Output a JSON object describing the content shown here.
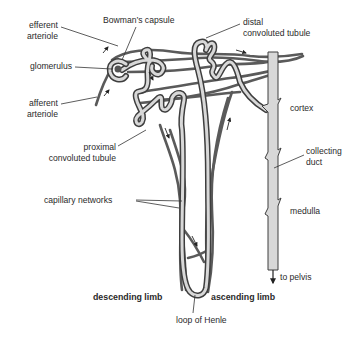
{
  "diagram": {
    "colors": {
      "vessel": "#555555",
      "tubule_outline": "#444444",
      "tubule_fill": "#d9d9d9",
      "leader_line": "#333333",
      "text": "#2a2a2a",
      "background": "#ffffff"
    },
    "labels": {
      "efferent_arteriole": [
        "efferent",
        "arteriole"
      ],
      "bowmans_capsule": "Bowman’s capsule",
      "distal_tubule": [
        "distal",
        "convoluted tubule"
      ],
      "glomerulus": "glomerulus",
      "afferent_arteriole": [
        "afferent",
        "arteriole"
      ],
      "cortex": "cortex",
      "proximal_tubule": [
        "proximal",
        "convoluted tubule"
      ],
      "collecting_duct": [
        "collecting",
        "duct"
      ],
      "capillary_networks": "capillary networks",
      "medulla": "medulla",
      "to_pelvis": "to pelvis",
      "descending_limb": "descending limb",
      "ascending_limb": "ascending limb",
      "loop_of_henle": "loop of Henle"
    }
  }
}
